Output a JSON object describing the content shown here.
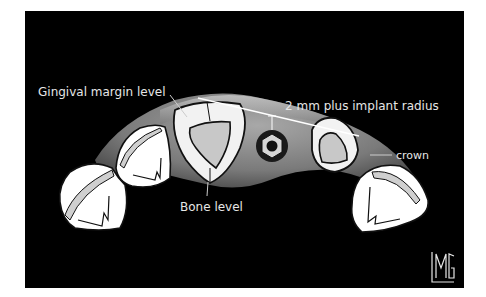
{
  "figure": {
    "labels": {
      "gingival_margin": "Gingival margin level",
      "implant_distance": "2 mm plus implant radius",
      "crown": "crown",
      "bone_level": "Bone level"
    },
    "logo": "LMG",
    "colors": {
      "background": "#000000",
      "gingiva": "#8a8a8a",
      "bone": "#c8c8c8",
      "tooth": "#ffffff",
      "text": "#e6e6e6"
    }
  }
}
